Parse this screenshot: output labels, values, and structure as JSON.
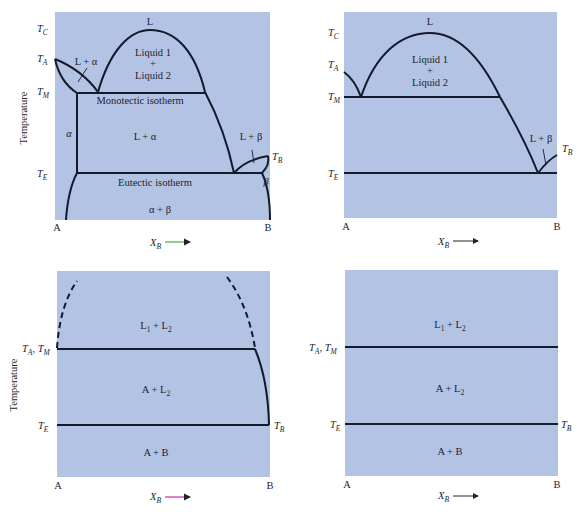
{
  "figure": {
    "y_axis_label": "Temperature",
    "x_axis_label": "X",
    "x_axis_sub": "B",
    "arrow_colors": {
      "panel1": "#3cb44b",
      "panel2": "#222222",
      "panel3": "#d42ca8",
      "panel4": "#222222"
    },
    "background_color": "#b3c3e3",
    "line_color": "#141a2e"
  },
  "panels": [
    {
      "id": "panel-1",
      "left_label": "A",
      "right_label": "B",
      "temps": {
        "TC": {
          "main": "T",
          "sub": "C"
        },
        "TA": {
          "main": "T",
          "sub": "A"
        },
        "TM": {
          "main": "T",
          "sub": "M"
        },
        "TE": {
          "main": "T",
          "sub": "E"
        },
        "TB": {
          "main": "T",
          "sub": "B"
        }
      },
      "regions": {
        "L": "L",
        "L_alpha_top": "L + α",
        "liquid1": "Liquid 1",
        "plus": "+",
        "liquid2": "Liquid 2",
        "monotectic": "Monotectic isotherm",
        "alpha": "α",
        "L_alpha": "L + α",
        "L_beta": "L + β",
        "beta": "β",
        "eutectic": "Eutectic isotherm",
        "alpha_beta": "α + β"
      }
    },
    {
      "id": "panel-2",
      "left_label": "A",
      "right_label": "B",
      "temps": {
        "TC": {
          "main": "T",
          "sub": "C"
        },
        "TA": {
          "main": "T",
          "sub": "A"
        },
        "TM": {
          "main": "T",
          "sub": "M"
        },
        "TE": {
          "main": "T",
          "sub": "E"
        },
        "TB": {
          "main": "T",
          "sub": "B"
        }
      },
      "regions": {
        "L": "L",
        "liquid1": "Liquid 1",
        "plus": "+",
        "liquid2": "Liquid 2",
        "L_beta": "L + β"
      }
    },
    {
      "id": "panel-3",
      "left_label": "A",
      "right_label": "B",
      "temps": {
        "TATM": {
          "a": "T",
          "asub": "A",
          "sep": ", ",
          "m": "T",
          "msub": "M"
        },
        "TE": {
          "main": "T",
          "sub": "E"
        },
        "TB": {
          "main": "T",
          "sub": "B"
        }
      },
      "regions": {
        "L1L2": {
          "a": "L",
          "asub": "1",
          "mid": " + L",
          "bsub": "2"
        },
        "AL2": {
          "a": "A + L",
          "bsub": "2"
        },
        "AB": "A + B"
      }
    },
    {
      "id": "panel-4",
      "left_label": "A",
      "right_label": "B",
      "temps": {
        "TATM": {
          "a": "T",
          "asub": "A",
          "sep": ", ",
          "m": "T",
          "msub": "M"
        },
        "TE": {
          "main": "T",
          "sub": "E"
        },
        "TB": {
          "main": "T",
          "sub": "B"
        }
      },
      "regions": {
        "L1L2": {
          "a": "L",
          "asub": "1",
          "mid": " + L",
          "bsub": "2"
        },
        "AL2": {
          "a": "A + L",
          "bsub": "2"
        },
        "AB": "A + B"
      }
    }
  ]
}
